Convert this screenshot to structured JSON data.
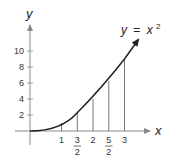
{
  "diagram": {
    "curve_label": {
      "lhs": "y",
      "eq": "=",
      "rhs": "x",
      "exp": "2"
    },
    "x_axis": {
      "label": "x",
      "ticks": [
        "1",
        "3/2",
        "2",
        "5/2",
        "3"
      ],
      "tick_values": [
        1,
        1.5,
        2,
        2.5,
        3
      ]
    },
    "y_axis": {
      "label": "y",
      "ticks": [
        "2",
        "4",
        "6",
        "8",
        "10"
      ],
      "tick_values": [
        2,
        4,
        6,
        8,
        10
      ]
    },
    "vertical_lines_at_x": [
      1,
      1.5,
      2,
      2.5,
      3
    ],
    "function": "y = x^2",
    "colors": {
      "axis": "#888888",
      "curve": "#222222",
      "text": "#333333"
    }
  },
  "labels": {
    "y_axis": "y",
    "x_axis": "x",
    "curve_lhs": "y",
    "curve_eq": "=",
    "curve_rhs": "x",
    "curve_exp": "2",
    "xt1": "1",
    "xt15n": "3",
    "xt15d": "2",
    "xt2": "2",
    "xt25n": "5",
    "xt25d": "2",
    "xt3": "3",
    "yt2": "2",
    "yt4": "4",
    "yt6": "6",
    "yt8": "8",
    "yt10": "10"
  }
}
